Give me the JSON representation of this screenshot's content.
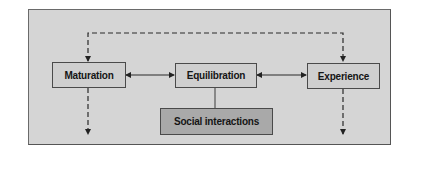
{
  "diagram": {
    "nodes": [
      {
        "id": "maturation",
        "label": "Maturation"
      },
      {
        "id": "equilibration",
        "label": "Equilibration"
      },
      {
        "id": "experience",
        "label": "Experience"
      },
      {
        "id": "social",
        "label": "Social interactions"
      }
    ],
    "edges": [
      {
        "from": "maturation",
        "to": "equilibration",
        "style": "solid",
        "direction": "both"
      },
      {
        "from": "equilibration",
        "to": "experience",
        "style": "solid",
        "direction": "both"
      },
      {
        "from": "equilibration",
        "to": "social",
        "style": "solid",
        "direction": "none"
      },
      {
        "from": "maturation",
        "to": "experience",
        "style": "dashed",
        "direction": "both",
        "route": "over-top"
      },
      {
        "from": "maturation",
        "to": "outside-below",
        "style": "dashed",
        "direction": "forward"
      },
      {
        "from": "experience",
        "to": "outside-below",
        "style": "dashed",
        "direction": "forward"
      }
    ],
    "colors": {
      "background": "#d5d5d5",
      "node_fill": "#cfcfcf",
      "social_fill": "#a9a9a9",
      "stroke": "#2a2a2a"
    }
  }
}
